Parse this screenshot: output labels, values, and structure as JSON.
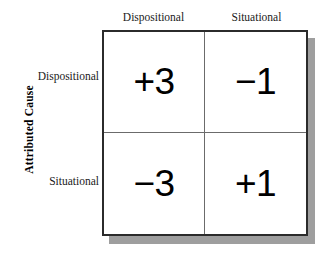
{
  "figure": {
    "vertical_axis_title": "Attributed Cause",
    "column_headers": [
      "Dispositional",
      "Situational"
    ],
    "row_headers": [
      "Dispositional",
      "Situational"
    ],
    "colors": {
      "background": "#ffffff",
      "outer_border": "#2b2b2b",
      "inner_grid": "#6b6b6b",
      "shadow": "#9e9e9e",
      "text": "#000000"
    }
  },
  "chart_data": {
    "type": "table",
    "title": "",
    "xlabel": "",
    "ylabel": "Attributed Cause",
    "columns": [
      "Dispositional",
      "Situational"
    ],
    "rows": [
      "Dispositional",
      "Situational"
    ],
    "cells": [
      [
        "+3",
        "−1"
      ],
      [
        "−3",
        "+1"
      ]
    ],
    "values": [
      [
        3,
        -1
      ],
      [
        -3,
        1
      ]
    ],
    "grid": true,
    "legend": "none"
  }
}
